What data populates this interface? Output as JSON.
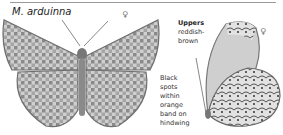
{
  "species": {
    "name": "M. arduinna"
  },
  "symbols": {
    "female_left": "♀",
    "female_right": "♀"
  },
  "captions": {
    "uppers": {
      "heading": "Uppers",
      "line1": "reddish-",
      "line2": "brown"
    },
    "hindwing": {
      "line1": "Black",
      "line2": "spots",
      "line3": "within",
      "line4": "orange",
      "line5": "band on",
      "line6": "hindwing"
    }
  },
  "illustrations": {
    "left": "butterfly-upperside-female",
    "right": "butterfly-underside-female"
  },
  "colors": {
    "rule": "#9a9a9a",
    "wing_dark": "#6e6e6e",
    "wing_light": "#c8c8c8"
  }
}
